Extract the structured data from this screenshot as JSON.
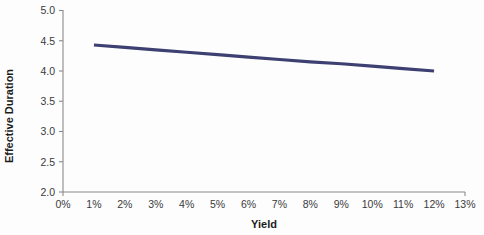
{
  "chart_data": {
    "type": "line",
    "title": "",
    "title_visible": false,
    "title_note": "chart title is cropped off the top edge of the screenshot and is not legible",
    "xlabel": "Yield",
    "ylabel": "Effective Duration",
    "xlim": [
      0,
      13
    ],
    "ylim": [
      2.0,
      5.0
    ],
    "grid": false,
    "legend": false,
    "x_tick_labels": [
      "0%",
      "1%",
      "2%",
      "3%",
      "4%",
      "5%",
      "6%",
      "7%",
      "8%",
      "9%",
      "10%",
      "11%",
      "12%",
      "13%"
    ],
    "x_tick_values": [
      0,
      1,
      2,
      3,
      4,
      5,
      6,
      7,
      8,
      9,
      10,
      11,
      12,
      13
    ],
    "y_tick_labels": [
      "2.0",
      "2.5",
      "3.0",
      "3.5",
      "4.0",
      "4.5",
      "5.0"
    ],
    "y_tick_values": [
      2.0,
      2.5,
      3.0,
      3.5,
      4.0,
      4.5,
      5.0
    ],
    "series": [
      {
        "name": "Effective Duration",
        "color": "#3d4070",
        "line_width": 3.2,
        "x": [
          1,
          2,
          3,
          4,
          5,
          6,
          7,
          8,
          9,
          10,
          11,
          12
        ],
        "values": [
          4.43,
          4.39,
          4.35,
          4.31,
          4.27,
          4.23,
          4.19,
          4.15,
          4.12,
          4.08,
          4.04,
          4.0
        ]
      }
    ]
  },
  "axes": {
    "y_title": "Effective Duration",
    "x_title": "Yield"
  },
  "colors": {
    "series": "#3d4070",
    "axis": "#8a8a8a",
    "text": "#3a3a3a",
    "title_text": "#1c1c1c",
    "background": "#fdfdfe"
  }
}
